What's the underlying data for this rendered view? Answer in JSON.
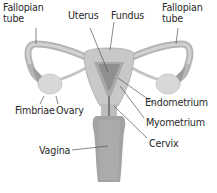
{
  "diagram": {
    "colors": {
      "tissue_light": "#d4d4d4",
      "tissue_mid": "#b8b8b8",
      "tissue_dark": "#8f8f8f",
      "leader_line": "#555555",
      "label_text": "#2a2a2a",
      "background": "#ffffff"
    },
    "labels": {
      "fallopian_tube_left": [
        "Fallopian",
        "tube"
      ],
      "uterus": "Uterus",
      "fundus": "Fundus",
      "fallopian_tube_right": [
        "Fallopian",
        "tube"
      ],
      "endometrium": "Endometrium",
      "fimbriae": "Fimbriae",
      "ovary": "Ovary",
      "myometrium": "Myometrium",
      "vagina": "Vagina",
      "cervix": "Cervix"
    }
  }
}
